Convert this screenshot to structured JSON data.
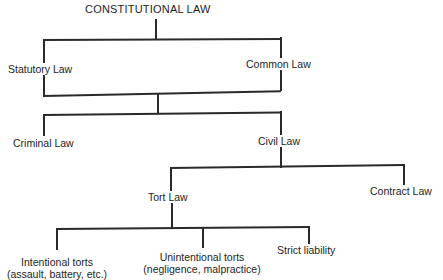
{
  "diagram": {
    "type": "hierarchy-tree",
    "root": {
      "label": "CONSTITUTIONAL LAW",
      "children": [
        "Statutory Law",
        "Common Law"
      ]
    },
    "nodes": {
      "constitutional": "CONSTITUTIONAL LAW",
      "statutory": "Statutory Law",
      "common": "Common Law",
      "criminal": "Criminal Law",
      "civil": "Civil Law",
      "tort": "Tort Law",
      "contract": "Contract Law",
      "intentional": "Intentional torts",
      "intentional_examples": "(assault, battery, etc.)",
      "unintentional": "Unintentional torts",
      "unintentional_examples": "(negligence, malpractice)",
      "strict": "Strict liability"
    },
    "edges": [
      [
        "CONSTITUTIONAL LAW",
        "Statutory Law"
      ],
      [
        "CONSTITUTIONAL LAW",
        "Common Law"
      ],
      [
        "Statutory Law + Common Law",
        "Criminal Law"
      ],
      [
        "Statutory Law + Common Law",
        "Civil Law"
      ],
      [
        "Civil Law",
        "Tort Law"
      ],
      [
        "Civil Law",
        "Contract Law"
      ],
      [
        "Tort Law",
        "Intentional torts"
      ],
      [
        "Tort Law",
        "Unintentional torts"
      ],
      [
        "Tort Law",
        "Strict liability"
      ]
    ],
    "line_color": "#2a2a2a",
    "text_color": "#1e1e1e",
    "background": "#ffffff"
  }
}
